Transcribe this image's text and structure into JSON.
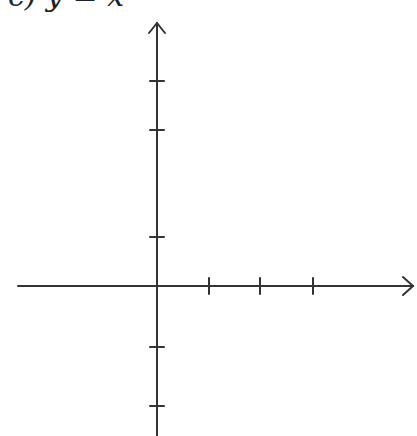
{
  "title": {
    "text": "c) y = x²",
    "clipped": true
  },
  "axes": {
    "stroke_color": "#333333",
    "origin": {
      "x": 157,
      "y": 286
    },
    "x_axis": {
      "start_x": 18,
      "end_x": 413,
      "ticks_x": [
        209,
        260,
        313
      ],
      "arrow": "right"
    },
    "y_axis": {
      "top_y": 23,
      "bottom_y": 436,
      "ticks_y": [
        81,
        130,
        237,
        347,
        406
      ],
      "arrow": "up"
    }
  }
}
